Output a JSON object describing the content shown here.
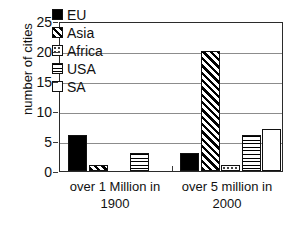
{
  "chart_data": {
    "type": "bar",
    "title": "",
    "xlabel": "",
    "ylabel": "number of cities",
    "ylim": [
      0,
      25
    ],
    "yticks": [
      0,
      5,
      10,
      15,
      20,
      25
    ],
    "grid": true,
    "legend_position": "top-center-inside",
    "categories": [
      "over 1 Million in 1900",
      "over 5 million in 2000"
    ],
    "category_lines": [
      [
        "over 1 Million in",
        "1900"
      ],
      [
        "over 5 million in",
        "2000"
      ]
    ],
    "series": [
      {
        "name": "EU",
        "pattern": "solid",
        "values": [
          6,
          3
        ]
      },
      {
        "name": "Asia",
        "pattern": "diagonal",
        "values": [
          1,
          20
        ]
      },
      {
        "name": "Africa",
        "pattern": "dotted",
        "values": [
          0,
          1
        ]
      },
      {
        "name": "USA",
        "pattern": "horizontal",
        "values": [
          3,
          6
        ]
      },
      {
        "name": "SA",
        "pattern": "empty",
        "values": [
          0,
          7
        ]
      }
    ]
  },
  "colors": {
    "bar_outline": "#111111",
    "fill_black": "#000000",
    "fill_white": "#ffffff",
    "gridline": "#8c8c8c",
    "frame": "#2b2b2b",
    "text": "#111111",
    "background": "#ffffff"
  }
}
